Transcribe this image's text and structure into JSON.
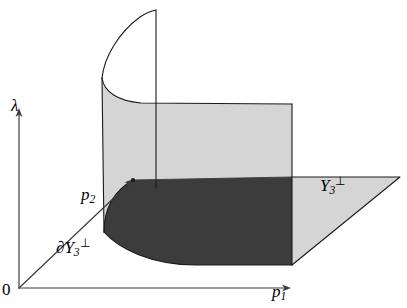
{
  "figure": {
    "background_color": "#ffffff",
    "line_color": "#1a1a1a",
    "axis_color": "#3c3c3c",
    "light_fill": "#d5d5d5",
    "dark_fill": "#3c3c3c",
    "width": 407,
    "height": 308
  },
  "axes": [
    {
      "name": "lambda-axis",
      "label": "λ",
      "direction": "vertical-up",
      "origin": {
        "x": 19,
        "y": 288
      },
      "tip": {
        "x": 19,
        "y": 110
      }
    },
    {
      "name": "p1-axis",
      "label": "p",
      "subscript": "1",
      "direction": "horizontal-right",
      "origin": {
        "x": 19,
        "y": 288
      },
      "tip": {
        "x": 290,
        "y": 288
      }
    },
    {
      "name": "p2-axis",
      "label": "p",
      "subscript": "2",
      "direction": "diagonal-up-right",
      "origin": {
        "x": 19,
        "y": 288
      },
      "tip": {
        "x": 133,
        "y": 180
      }
    }
  ],
  "labels": {
    "origin": "0",
    "lambda": "λ",
    "p1_base": "p",
    "p1_sub": "1",
    "p2_base": "p",
    "p2_sub": "2",
    "boundary_base": "∂Y",
    "boundary_sub": "3",
    "boundary_perp": "⊥",
    "region_base": "Y",
    "region_sub": "3",
    "region_perp": "⊥"
  },
  "regions": [
    {
      "name": "ground-plane",
      "fill": "#d5d5d5",
      "description": "Horizontal plane Y_3 perpendicular drawn in perspective, extending to the right of the cylinder"
    },
    {
      "name": "cylinder-wall",
      "fill": "#d5d5d5",
      "description": "Light gray vertical cylindrical surface rising from the curved boundary"
    },
    {
      "name": "base-region",
      "fill": "#3c3c3c",
      "description": "Dark shaded base region bounded by the curve and the axes"
    }
  ],
  "markers": [
    {
      "name": "p2-endpoint-dot",
      "x": 133,
      "y": 180
    }
  ]
}
